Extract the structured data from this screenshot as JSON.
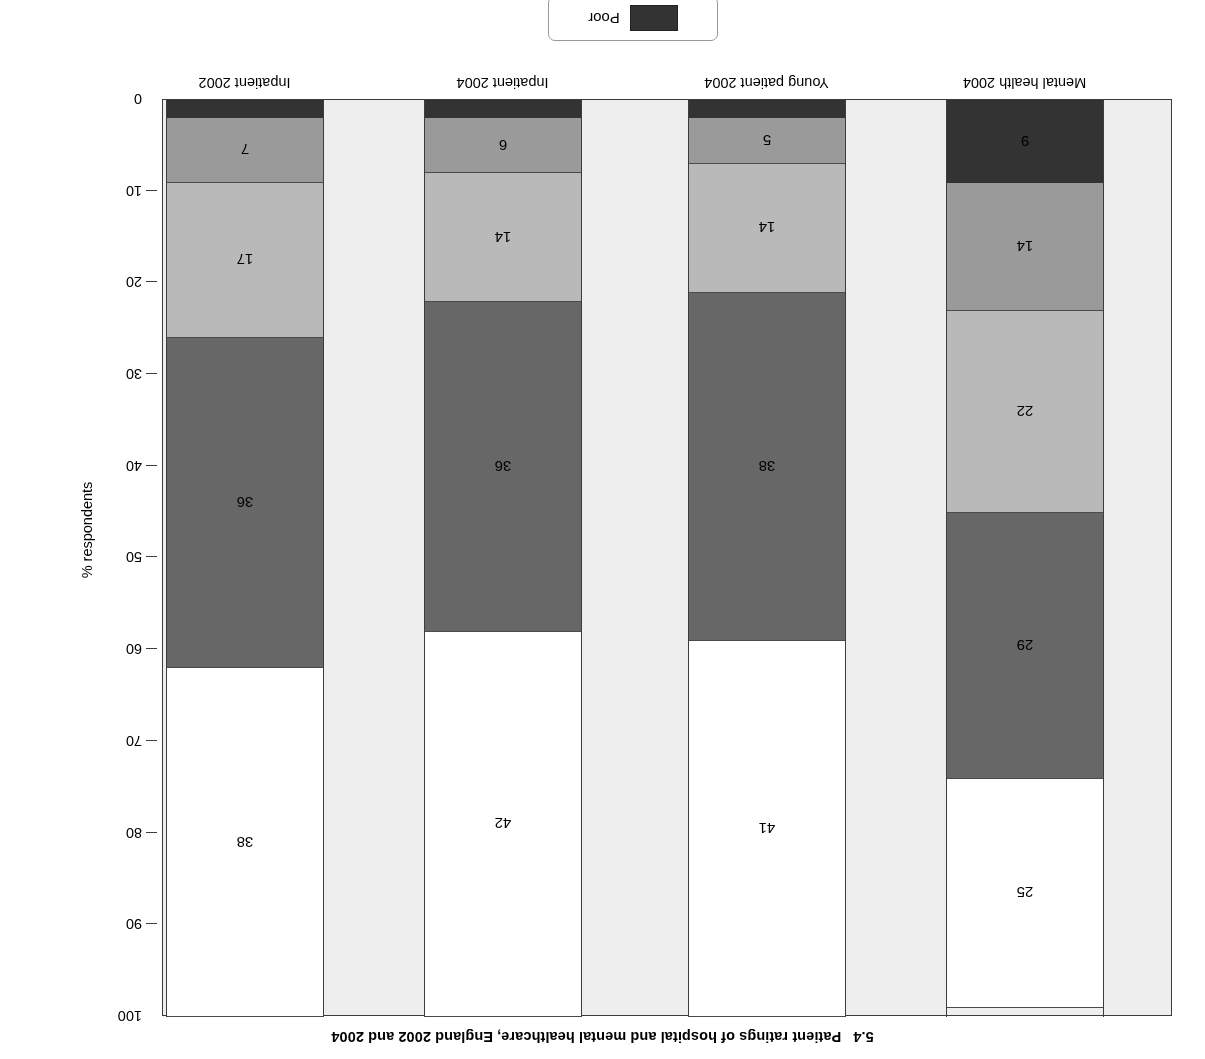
{
  "caption": {
    "number": "5.4",
    "text": "Patient ratings of hospital and mental healthcare, England 2002 and 2004"
  },
  "legend": {
    "entries": [
      {
        "label": "Poor",
        "color": "#333333"
      }
    ]
  },
  "axis": {
    "ylabel": "% respondents",
    "ticks": [
      "0",
      "10",
      "20",
      "30",
      "40",
      "50",
      "60",
      "70",
      "80",
      "90",
      "100"
    ]
  },
  "chart_data": {
    "type": "bar",
    "subtitle": "",
    "xlabel": "",
    "ylabel": "% respondents",
    "ylim": [
      0,
      100
    ],
    "grid": false,
    "stacked": true,
    "orientation": "vertical",
    "legend_position": "bottom-center",
    "categories": [
      "Inpatient 2002",
      "Inpatient 2004",
      "Young patient 2004",
      "Mental health 2004"
    ],
    "series": [
      {
        "name": "Poor",
        "color": "#333333",
        "values": [
          2,
          2,
          2,
          9
        ]
      },
      {
        "name": "series-2",
        "color": "#9a9a9a",
        "values": [
          7,
          6,
          5,
          14
        ]
      },
      {
        "name": "series-3",
        "color": "#b9b9b9",
        "values": [
          17,
          14,
          14,
          22
        ]
      },
      {
        "name": "series-4",
        "color": "#676767",
        "values": [
          36,
          36,
          38,
          29
        ]
      },
      {
        "name": "series-5",
        "color": "#ffffff",
        "values": [
          38,
          42,
          41,
          25
        ]
      }
    ]
  },
  "colors": {
    "plot_background": "#eeeeee",
    "page_background": "#ffffff",
    "axis": "#3c3c3c",
    "poor": "#333333",
    "mid_grey": "#9a9a9a",
    "light_grey": "#b9b9b9",
    "dark_grey": "#676767",
    "white_segment": "#ffffff"
  }
}
